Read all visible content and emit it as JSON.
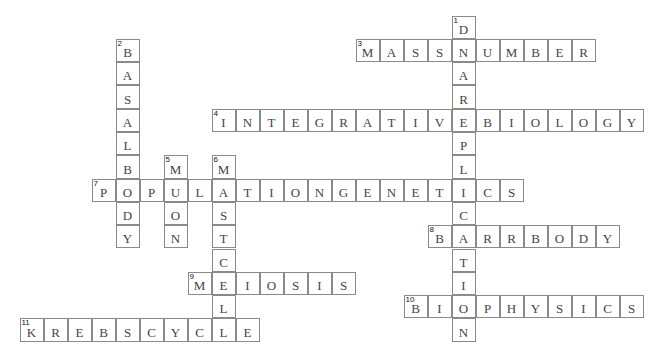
{
  "puzzle": {
    "type": "crossword",
    "grid": {
      "origin_x": 20,
      "origin_y": 16,
      "cell_w": 24,
      "cell_h": 23.3
    },
    "words": [
      {
        "number": "1",
        "direction": "down",
        "row": 0,
        "col": 18,
        "answer": "DNAREPLICATION"
      },
      {
        "number": "2",
        "direction": "down",
        "row": 1,
        "col": 4,
        "answer": "BASALBODY"
      },
      {
        "number": "3",
        "direction": "across",
        "row": 1,
        "col": 14,
        "answer": "MASSNUMBER"
      },
      {
        "number": "4",
        "direction": "across",
        "row": 4,
        "col": 8,
        "answer": "INTEGRATIVEBIOLOGY"
      },
      {
        "number": "5",
        "direction": "down",
        "row": 6,
        "col": 6,
        "answer": "MUON"
      },
      {
        "number": "6",
        "direction": "down",
        "row": 6,
        "col": 8,
        "answer": "MASTCELL"
      },
      {
        "number": "7",
        "direction": "across",
        "row": 7,
        "col": 3,
        "answer": "POPULATIONGENETICS"
      },
      {
        "number": "8",
        "direction": "across",
        "row": 9,
        "col": 17,
        "answer": "BARRBODY"
      },
      {
        "number": "9",
        "direction": "across",
        "row": 11,
        "col": 7,
        "answer": "MEIOSIS"
      },
      {
        "number": "10",
        "direction": "across",
        "row": 12,
        "col": 16,
        "answer": "BIOPHYSICS"
      },
      {
        "number": "11",
        "direction": "across",
        "row": 13,
        "col": 0,
        "answer": "KREBSCYCLE"
      }
    ]
  },
  "colors": {
    "border": "#8a8a8a",
    "letter": "#444444",
    "number": "#111111",
    "background": "#ffffff"
  }
}
